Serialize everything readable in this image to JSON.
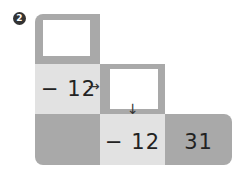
{
  "problem": {
    "number_marker": "2",
    "row2_col1_value": "− 12",
    "row3_col2_value": "− 12",
    "row3_col3_value": "31",
    "arrow_right": "→",
    "arrow_down": "↓"
  },
  "colors": {
    "dark_gray": "#a9a9a9",
    "light_gray": "#e2e2e2",
    "blank_box": "#ffffff"
  }
}
